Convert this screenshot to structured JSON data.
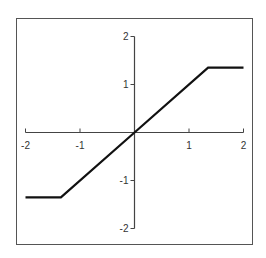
{
  "chart_data": {
    "type": "line",
    "title": "",
    "xlabel": "",
    "ylabel": "",
    "xlim": [
      -2,
      2
    ],
    "ylim": [
      -2,
      2
    ],
    "grid": false,
    "legend": null,
    "x_ticks": [
      -2,
      -1,
      1,
      2
    ],
    "y_ticks": [
      -2,
      -1,
      1,
      2
    ],
    "x_tick_labels": [
      "-2",
      "-1",
      "1",
      "2"
    ],
    "y_tick_labels": [
      "-2",
      "-1",
      "1",
      "2"
    ],
    "series": [
      {
        "name": "saturation",
        "color": "#111111",
        "x": [
          -2,
          -1.35,
          0,
          1.35,
          2
        ],
        "y": [
          -1.35,
          -1.35,
          0,
          1.35,
          1.35
        ]
      }
    ]
  },
  "colors": {
    "frame": "#555555",
    "axis": "#444444",
    "line": "#111111",
    "background": "#ffffff"
  }
}
